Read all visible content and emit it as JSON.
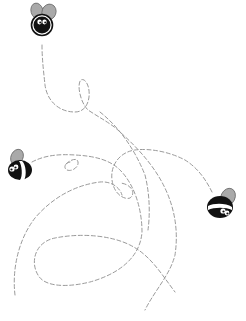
{
  "scene": {
    "description": "Three cartoon bees with dashed flight trails on white background",
    "background": "#ffffff",
    "trail_color": "#9a9a9a",
    "bees": [
      {
        "name": "top-bee",
        "facing": "front"
      },
      {
        "name": "left-bee",
        "facing": "left"
      },
      {
        "name": "right-bee",
        "facing": "right"
      }
    ]
  }
}
